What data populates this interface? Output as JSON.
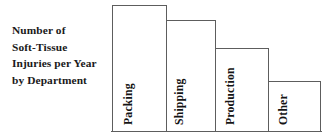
{
  "chart_data": {
    "type": "bar",
    "title": "Number of Soft-Tissue Injuries per Year by Department",
    "title_lines": [
      "Number of",
      "Soft-Tissue",
      "Injuries per Year",
      "by Department"
    ],
    "categories": [
      "Packing",
      "Shipping",
      "Production",
      "Other"
    ],
    "values": [
      127,
      112,
      84,
      51
    ],
    "xlabel": "",
    "ylabel": "",
    "ylim": [
      0,
      135
    ],
    "grid": false,
    "legend": false,
    "axis": {
      "baseline_visible": true,
      "y_axis_visible": false,
      "tick_labels": []
    },
    "style": {
      "bar_fill": "#ffffff",
      "bar_stroke": "#5d5d5d",
      "background": "#ffffff",
      "text_color": "#141414",
      "label_orientation": "vertical-90ccw"
    }
  },
  "bars": [
    {
      "label": "Packing",
      "value": 127,
      "left": 1,
      "width": 55,
      "height": 127
    },
    {
      "label": "Shipping",
      "value": 112,
      "left": 55,
      "width": 50,
      "height": 112
    },
    {
      "label": "Production",
      "value": 84,
      "left": 104,
      "width": 54,
      "height": 84
    },
    {
      "label": "Other",
      "value": 51,
      "left": 157,
      "width": 53,
      "height": 51
    }
  ]
}
